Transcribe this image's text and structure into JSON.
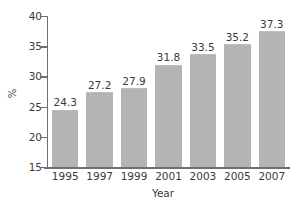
{
  "chart_data": {
    "type": "bar",
    "title": "",
    "xlabel": "Year",
    "ylabel": "%",
    "categories": [
      "1995",
      "1997",
      "1999",
      "2001",
      "2003",
      "2005",
      "2007"
    ],
    "values": [
      24.3,
      27.2,
      27.9,
      31.8,
      33.5,
      35.2,
      37.3
    ],
    "value_labels": [
      "24.3",
      "27.2",
      "27.9",
      "31.8",
      "33.5",
      "35.2",
      "37.3"
    ],
    "ylim": [
      15,
      40
    ],
    "yticks": [
      15,
      20,
      25,
      30,
      35,
      40
    ],
    "ytick_labels": [
      "15",
      "20",
      "25",
      "30",
      "35",
      "40"
    ],
    "grid": false,
    "legend": false,
    "bar_color": "#b4b4b4",
    "axis_color": "#6f6f6f",
    "text_color": "#3a3a3a",
    "background_color": "#ffffff"
  }
}
